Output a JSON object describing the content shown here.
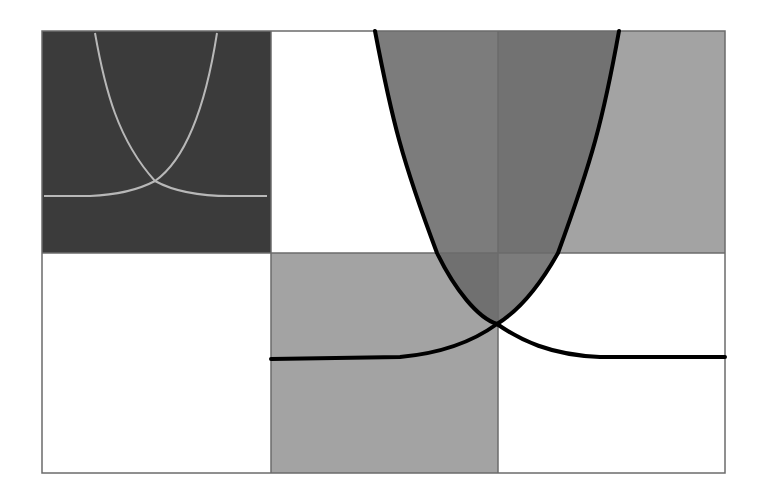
{
  "diagram": {
    "title": "",
    "grid": {
      "x": [
        42,
        271,
        498,
        725
      ],
      "y": [
        31,
        253,
        473
      ],
      "border_color": "#6b6b6b"
    },
    "cells": [
      {
        "id": "top-left",
        "fill": "#3b3b3b"
      },
      {
        "id": "top-middle",
        "fill": "#ffffff"
      },
      {
        "id": "top-right",
        "fill": "#a3a3a3"
      },
      {
        "id": "bottom-left",
        "fill": "#ffffff"
      },
      {
        "id": "bottom-middle",
        "fill": "#a3a3a3"
      },
      {
        "id": "bottom-right",
        "fill": "#ffffff"
      }
    ],
    "regions": {
      "between_curves_fill": "#7c7c7c",
      "overlap_fill": "#707070"
    },
    "curves": {
      "main": {
        "color": "#000000",
        "width": 4,
        "crossing": [
          497,
          324
        ],
        "asymptote_y": 358,
        "left_branch_top_x": 375,
        "right_branch_top_x": 619
      },
      "inset": {
        "color": "#b8b8b8",
        "width": 2,
        "crossing": [
          155,
          181
        ],
        "asymptote_y": 196,
        "left_branch_top_x": 95,
        "right_branch_top_x": 217
      }
    }
  }
}
